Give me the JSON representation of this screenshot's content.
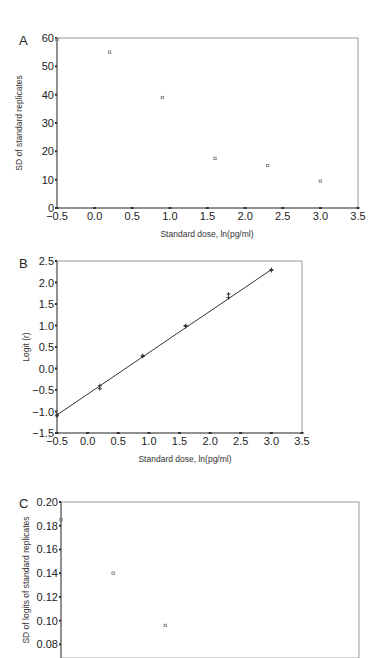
{
  "chart_data": [
    {
      "panel": "A",
      "type": "scatter",
      "title": "",
      "xlabel": "Standard dose, ln(pg/ml)",
      "ylabel": "SD of standard replicates",
      "xlim": [
        -0.5,
        3.5
      ],
      "ylim": [
        0,
        60
      ],
      "xticks": [
        "−0.5",
        "0.0",
        "0.5",
        "1.0",
        "1.5",
        "2.0",
        "2.5",
        "3.0",
        "3.5"
      ],
      "yticks": [
        "0",
        "10",
        "20",
        "30",
        "40",
        "50",
        "60"
      ],
      "grid": false,
      "x": [
        -0.5,
        0.2,
        0.9,
        1.6,
        2.3,
        3.0
      ],
      "y": [
        59.5,
        55,
        39,
        17.5,
        15,
        9.5
      ]
    },
    {
      "panel": "B",
      "type": "scatter",
      "title": "",
      "xlabel": "Standard dose, ln(pg/ml)",
      "ylabel": "Logit (r)",
      "xlim": [
        -0.5,
        3.5
      ],
      "ylim": [
        -1.5,
        2.5
      ],
      "xticks": [
        "−0.5",
        "0.0",
        "0.5",
        "1.0",
        "1.5",
        "2.0",
        "2.5",
        "3.0",
        "3.5"
      ],
      "yticks": [
        "−1.5",
        "−1.0",
        "−0.5",
        "0.0",
        "0.5",
        "1.0",
        "1.5",
        "2.0",
        "2.5"
      ],
      "grid": false,
      "x": [
        -0.5,
        -0.5,
        0.2,
        0.2,
        0.9,
        0.9,
        1.6,
        1.6,
        2.3,
        2.3,
        3.0,
        3.0
      ],
      "y": [
        -1.08,
        -1.1,
        -0.4,
        -0.47,
        0.3,
        0.28,
        1.0,
        0.98,
        1.73,
        1.65,
        2.3,
        2.28
      ],
      "fit_line": {
        "x": [
          -0.5,
          3.0
        ],
        "y": [
          -1.08,
          2.3
        ]
      }
    },
    {
      "panel": "C",
      "type": "scatter",
      "title": "",
      "xlabel": "",
      "ylabel": "SD of logits of standard replicates",
      "ylim": [
        0.05,
        0.2
      ],
      "yticks": [
        "0.06",
        "0.08",
        "0.10",
        "0.12",
        "0.14",
        "0.16",
        "0.18",
        "0.20"
      ],
      "grid": false,
      "x": [
        -0.5,
        0.2,
        0.9,
        1.6,
        2.3,
        3.0
      ],
      "y": [
        0.185,
        0.14,
        0.096,
        0.054,
        0.068,
        0.066
      ]
    }
  ],
  "panels": {
    "a": {
      "label": "A",
      "xlabel": "Standard dose, ln(pg/ml)",
      "ylabel": "SD of standard replicates"
    },
    "b": {
      "label": "B",
      "xlabel": "Standard dose, ln(pg/ml)",
      "ylabel": "Logit (r)"
    },
    "c": {
      "label": "C",
      "ylabel": "SD of logits of standard replicates"
    }
  }
}
